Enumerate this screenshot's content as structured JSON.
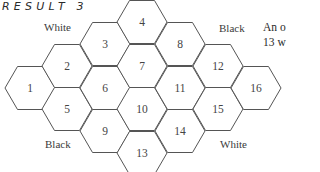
{
  "title": "RESULT 3",
  "labels": {
    "top_left": "White",
    "top_right": "Black",
    "bottom_left": "Black",
    "bottom_right": "White"
  },
  "side_text": {
    "line1": "An o",
    "line2": "13 w"
  },
  "colors": {
    "stroke": "#555555",
    "text": "#3a3a3a"
  },
  "hexes": [
    {
      "n": "1",
      "cx": 30,
      "cy": 88
    },
    {
      "n": "2",
      "cx": 67,
      "cy": 66
    },
    {
      "n": "3",
      "cx": 105,
      "cy": 44
    },
    {
      "n": "4",
      "cx": 142,
      "cy": 22
    },
    {
      "n": "5",
      "cx": 67,
      "cy": 109
    },
    {
      "n": "6",
      "cx": 105,
      "cy": 88
    },
    {
      "n": "7",
      "cx": 142,
      "cy": 66
    },
    {
      "n": "8",
      "cx": 180,
      "cy": 44
    },
    {
      "n": "9",
      "cx": 105,
      "cy": 131
    },
    {
      "n": "10",
      "cx": 142,
      "cy": 109
    },
    {
      "n": "11",
      "cx": 180,
      "cy": 88
    },
    {
      "n": "12",
      "cx": 218,
      "cy": 66
    },
    {
      "n": "13",
      "cx": 142,
      "cy": 153
    },
    {
      "n": "14",
      "cx": 180,
      "cy": 131
    },
    {
      "n": "15",
      "cx": 218,
      "cy": 109
    },
    {
      "n": "16",
      "cx": 256,
      "cy": 88
    }
  ]
}
